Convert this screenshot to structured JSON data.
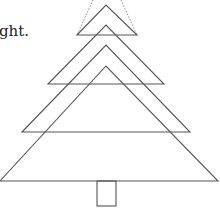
{
  "caption": {
    "text": "ght."
  },
  "diagram": {
    "type": "layered-tree",
    "stroke_color": "#555555",
    "guide_color": "#777777",
    "guides": [
      {
        "x1": 93,
        "y1": 0,
        "x2": 77,
        "y2": 35
      },
      {
        "x1": 121,
        "y1": 0,
        "x2": 137,
        "y2": 35
      }
    ],
    "triangles": [
      {
        "apex": [
          106,
          5
        ],
        "left": [
          77,
          35
        ],
        "right": [
          137,
          35
        ]
      },
      {
        "apex": [
          106,
          25
        ],
        "left": [
          48,
          84
        ],
        "right": [
          164,
          84
        ]
      },
      {
        "apex": [
          106,
          45
        ],
        "left": [
          22,
          132
        ],
        "right": [
          190,
          132
        ]
      },
      {
        "apex": [
          106,
          66
        ],
        "left": [
          0,
          181
        ],
        "right": [
          218,
          181
        ]
      }
    ],
    "trunk": {
      "x": 97,
      "y": 181,
      "width": 19,
      "height": 25
    }
  }
}
